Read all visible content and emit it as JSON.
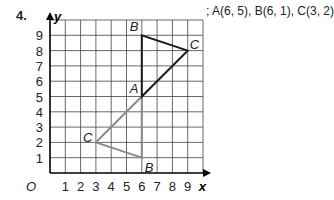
{
  "problem_number": "4.",
  "coords_text": "; A(6, 5), B(6, 1), C(3, 2)",
  "axes": {
    "x_label": "x",
    "y_label": "y",
    "origin_label": "O",
    "x_ticks": [
      1,
      2,
      3,
      4,
      5,
      6,
      7,
      8,
      9
    ],
    "y_ticks": [
      1,
      2,
      3,
      4,
      5,
      6,
      7,
      8,
      9
    ]
  },
  "grid": {
    "x0": 50,
    "y0": 173,
    "unit": 15.3,
    "cols": 10,
    "rows": 10
  },
  "original_triangle": {
    "color": "#1a1a1a",
    "points": {
      "A": [
        6,
        5
      ],
      "B": [
        6,
        9
      ],
      "C": [
        9,
        8
      ]
    }
  },
  "image_triangle": {
    "color": "#8a8a8a",
    "points": {
      "A": [
        6,
        5
      ],
      "B": [
        6,
        1
      ],
      "C": [
        3,
        2
      ]
    }
  }
}
